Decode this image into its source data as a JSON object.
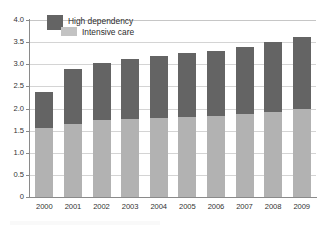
{
  "chart_data": {
    "type": "bar",
    "stacked": true,
    "title": "",
    "subtitle": "",
    "xlabel": "",
    "ylabel": "",
    "categories": [
      "2000",
      "2001",
      "2002",
      "2003",
      "2004",
      "2005",
      "2006",
      "2007",
      "2008",
      "2009"
    ],
    "series": [
      {
        "name": "Intensive care",
        "color": "#b2b2b2",
        "values": [
          1.56,
          1.64,
          1.73,
          1.76,
          1.78,
          1.8,
          1.82,
          1.88,
          1.93,
          1.99
        ]
      },
      {
        "name": "High dependency",
        "color": "#646464",
        "values": [
          0.81,
          1.25,
          1.3,
          1.35,
          1.41,
          1.45,
          1.48,
          1.52,
          1.57,
          1.62
        ]
      }
    ],
    "totals": [
      2.37,
      2.89,
      3.03,
      3.11,
      3.19,
      3.25,
      3.3,
      3.4,
      3.5,
      3.61
    ],
    "ylim": [
      0,
      4.0
    ],
    "ytick_values": [
      0,
      0.5,
      1.0,
      1.5,
      2.0,
      2.5,
      3.0,
      3.5,
      4.0
    ],
    "ytick_labels": [
      "0",
      "0.5",
      "1.0",
      "1.5",
      "2.0",
      "2.5",
      "3.0",
      "3.5",
      "4.0"
    ],
    "grid": "horizontal",
    "legend_position": "top-left"
  },
  "legend": {
    "entries": [
      {
        "label": "High dependency",
        "swatch": "dark"
      },
      {
        "label": "Intensive care",
        "swatch": "light"
      }
    ]
  },
  "colors": {
    "series_high_dependency": "#646464",
    "series_intensive_care": "#b2b2b2",
    "gridline": "#d4d4d4",
    "axis": "#8a8a8a",
    "text": "#333333",
    "background": "#ffffff"
  }
}
